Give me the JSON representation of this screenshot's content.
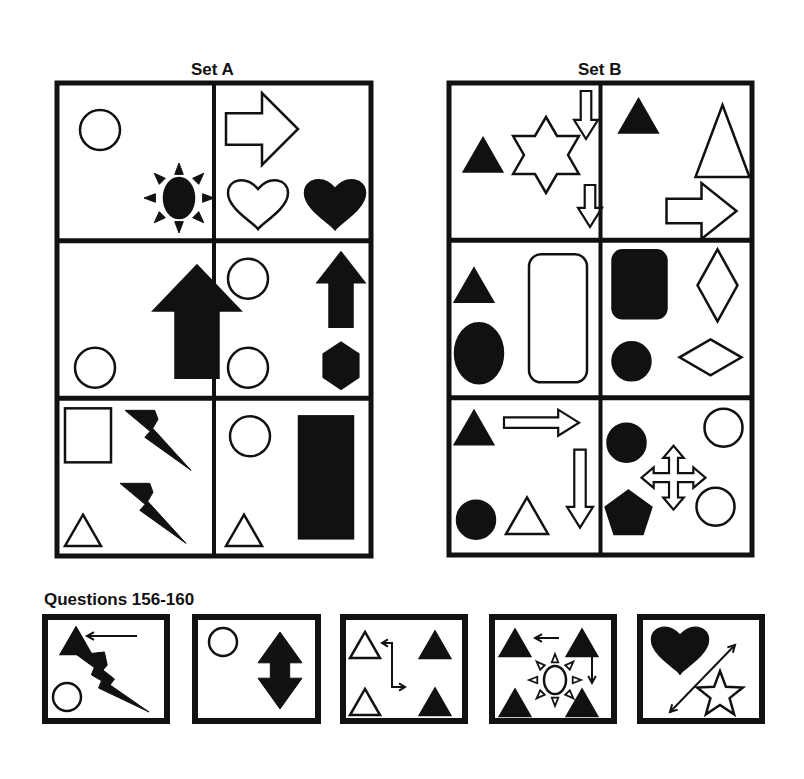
{
  "set_a": {
    "title": "Set A",
    "grid": {
      "x": 57,
      "y": 83,
      "w": 314,
      "h": 473,
      "rows": 3,
      "cols": 2
    },
    "cells": [
      {
        "name": "set-a-cell-1",
        "shapes": [
          {
            "type": "circle",
            "cx": 43,
            "cy": 47,
            "r": 20,
            "fill": false
          },
          {
            "type": "sun",
            "cx": 122,
            "cy": 115,
            "r": 15,
            "ry": 20,
            "ray": 35,
            "fill": true
          },
          {
            "type": "hidden"
          }
        ]
      },
      {
        "name": "set-a-cell-2",
        "shapes": [
          {
            "type": "block-arrow-right",
            "x": 12,
            "y": 10,
            "w": 72,
            "h": 72,
            "fill": false
          },
          {
            "type": "heart",
            "cx": 44,
            "cy": 120,
            "s": 30,
            "fill": false
          },
          {
            "type": "heart",
            "cx": 121,
            "cy": 120,
            "s": 30,
            "fill": true
          }
        ]
      },
      {
        "name": "set-a-cell-3",
        "shapes": [
          {
            "type": "circle",
            "cx": 38,
            "cy": 127,
            "r": 20,
            "fill": false
          },
          {
            "type": "block-arrow-up",
            "x": 97,
            "y": 25,
            "w": 86,
            "h": 112,
            "fill": true
          }
        ]
      },
      {
        "name": "set-a-cell-4",
        "shapes": [
          {
            "type": "circle",
            "cx": 34,
            "cy": 38,
            "r": 20,
            "fill": false
          },
          {
            "type": "circle",
            "cx": 34,
            "cy": 127,
            "r": 20,
            "fill": false
          },
          {
            "type": "block-arrow-up",
            "x": 104,
            "y": 12,
            "w": 46,
            "h": 74,
            "fill": true
          },
          {
            "type": "hexagon",
            "cx": 127,
            "cy": 125,
            "r": 23,
            "fill": true
          }
        ]
      },
      {
        "name": "set-a-cell-5",
        "shapes": [
          {
            "type": "rect",
            "x": 8,
            "y": 10,
            "w": 46,
            "h": 54,
            "fill": false
          },
          {
            "type": "lightning",
            "x": 68,
            "y": 12,
            "w": 66,
            "h": 60,
            "fill": true
          },
          {
            "type": "lightning",
            "x": 63,
            "y": 85,
            "w": 66,
            "h": 60,
            "fill": true
          },
          {
            "type": "triangle",
            "cx": 26,
            "cy": 132,
            "s": 36,
            "fill": false
          }
        ]
      },
      {
        "name": "set-a-cell-6",
        "shapes": [
          {
            "type": "circle",
            "cx": 36,
            "cy": 38,
            "r": 20,
            "fill": false
          },
          {
            "type": "triangle",
            "cx": 30,
            "cy": 132,
            "s": 36,
            "fill": false
          },
          {
            "type": "rect",
            "x": 85,
            "y": 18,
            "w": 54,
            "h": 122,
            "fill": true
          }
        ]
      }
    ]
  },
  "set_b": {
    "title": "Set B",
    "grid": {
      "x": 449,
      "y": 83,
      "w": 303,
      "h": 472,
      "rows": 3,
      "cols": 2
    },
    "cells": [
      {
        "name": "set-b-cell-1",
        "shapes": [
          {
            "type": "triangle",
            "cx": 34,
            "cy": 72,
            "s": 38,
            "fill": true
          },
          {
            "type": "star6",
            "cx": 97,
            "cy": 72,
            "r": 38,
            "fill": false
          },
          {
            "type": "thin-arrow-down-hollow",
            "x": 125,
            "y": 8,
            "w": 24,
            "h": 48,
            "fill": false
          },
          {
            "type": "thin-arrow-down-hollow",
            "x": 129,
            "y": 102,
            "w": 24,
            "h": 42,
            "fill": false
          }
        ]
      },
      {
        "name": "set-b-cell-2",
        "shapes": [
          {
            "type": "triangle",
            "cx": 38,
            "cy": 33,
            "s": 38,
            "fill": true
          },
          {
            "type": "triangle",
            "cx": 122,
            "cy": 58,
            "s": 54,
            "h": 72,
            "fill": false
          },
          {
            "type": "block-arrow-right",
            "x": 66,
            "y": 100,
            "w": 70,
            "h": 56,
            "fill": false
          }
        ]
      },
      {
        "name": "set-b-cell-3",
        "shapes": [
          {
            "type": "triangle",
            "cx": 25,
            "cy": 45,
            "s": 38,
            "fill": true
          },
          {
            "type": "ellipse",
            "cx": 30,
            "cy": 113,
            "rx": 24,
            "ry": 30,
            "fill": true
          },
          {
            "type": "roundrect",
            "x": 80,
            "y": 14,
            "w": 58,
            "h": 128,
            "rx": 12,
            "fill": false
          }
        ]
      },
      {
        "name": "set-b-cell-4",
        "shapes": [
          {
            "type": "roundrect",
            "x": 12,
            "y": 10,
            "w": 54,
            "h": 68,
            "rx": 10,
            "fill": true
          },
          {
            "type": "circle",
            "cx": 31,
            "cy": 121,
            "r": 19,
            "fill": true
          },
          {
            "type": "diamond",
            "cx": 117,
            "cy": 45,
            "w": 40,
            "h": 72,
            "fill": false
          },
          {
            "type": "diamond",
            "cx": 110,
            "cy": 117,
            "w": 62,
            "h": 36,
            "fill": false
          }
        ]
      },
      {
        "name": "set-b-cell-5",
        "shapes": [
          {
            "type": "triangle",
            "cx": 25,
            "cy": 30,
            "s": 38,
            "fill": true
          },
          {
            "type": "thin-arrow-right-hollow",
            "x": 55,
            "y": 12,
            "w": 75,
            "h": 26,
            "fill": false
          },
          {
            "type": "thin-arrow-down-hollow",
            "x": 118,
            "y": 52,
            "w": 26,
            "h": 78,
            "fill": false
          },
          {
            "type": "circle",
            "cx": 27,
            "cy": 122,
            "r": 19,
            "fill": true
          },
          {
            "type": "triangle",
            "cx": 78,
            "cy": 118,
            "s": 42,
            "fill": false
          }
        ]
      },
      {
        "name": "set-b-cell-6",
        "shapes": [
          {
            "type": "circle",
            "cx": 26,
            "cy": 45,
            "r": 19,
            "fill": true
          },
          {
            "type": "circle",
            "cx": 123,
            "cy": 30,
            "r": 19,
            "fill": false
          },
          {
            "type": "circle",
            "cx": 115,
            "cy": 109,
            "r": 19,
            "fill": false
          },
          {
            "type": "cross-arrows-hollow",
            "cx": 73,
            "cy": 80,
            "r": 32,
            "fill": false
          },
          {
            "type": "pentagon",
            "cx": 28,
            "cy": 117,
            "r": 24,
            "fill": true
          }
        ]
      }
    ]
  },
  "questions": {
    "title": "Questions 156-160",
    "boxes": [
      {
        "name": "question-156",
        "number": 156,
        "x": 45,
        "y": 617,
        "w": 122,
        "h": 104,
        "shapes": [
          {
            "type": "triangle",
            "cx": 31,
            "cy": 24,
            "s": 30,
            "fill": true
          },
          {
            "type": "line-arrow",
            "x1": 92,
            "y1": 19,
            "x2": 42,
            "y2": 19,
            "head": "end"
          },
          {
            "type": "lightning-long",
            "x": 32,
            "y": 35,
            "w": 72,
            "h": 60,
            "fill": true
          },
          {
            "type": "circle",
            "cx": 22,
            "cy": 80,
            "r": 14,
            "fill": false
          }
        ]
      },
      {
        "name": "question-157",
        "number": 157,
        "x": 195,
        "y": 617,
        "w": 123,
        "h": 104,
        "shapes": [
          {
            "type": "circle",
            "cx": 28,
            "cy": 25,
            "r": 14,
            "fill": false
          },
          {
            "type": "double-arrow-vertical",
            "cx": 85,
            "y1": 15,
            "y2": 92,
            "w": 44,
            "fill": true
          }
        ]
      },
      {
        "name": "question-158",
        "number": 158,
        "x": 343,
        "y": 617,
        "w": 122,
        "h": 104,
        "shapes": [
          {
            "type": "triangle",
            "cx": 22,
            "cy": 28,
            "s": 30,
            "fill": false
          },
          {
            "type": "triangle",
            "cx": 92,
            "cy": 28,
            "s": 30,
            "fill": true
          },
          {
            "type": "triangle",
            "cx": 22,
            "cy": 85,
            "s": 30,
            "fill": false
          },
          {
            "type": "triangle",
            "cx": 92,
            "cy": 85,
            "s": 30,
            "fill": true
          },
          {
            "type": "elbow-arrow",
            "points": "62,70 49,70 49,26 39,26",
            "end2": "62,70"
          }
        ]
      },
      {
        "name": "question-159",
        "number": 159,
        "x": 492,
        "y": 617,
        "w": 122,
        "h": 104,
        "shapes": [
          {
            "type": "triangle",
            "cx": 23,
            "cy": 26,
            "s": 30,
            "fill": true
          },
          {
            "type": "triangle",
            "cx": 90,
            "cy": 26,
            "s": 30,
            "fill": true
          },
          {
            "type": "triangle",
            "cx": 23,
            "cy": 86,
            "s": 30,
            "fill": true
          },
          {
            "type": "triangle",
            "cx": 90,
            "cy": 86,
            "s": 30,
            "fill": true
          },
          {
            "type": "line-arrow",
            "x1": 67,
            "y1": 21,
            "x2": 43,
            "y2": 21,
            "head": "end"
          },
          {
            "type": "line-arrow",
            "x1": 100,
            "y1": 40,
            "x2": 100,
            "y2": 66,
            "head": "end"
          },
          {
            "type": "sun",
            "cx": 63,
            "cy": 63,
            "r": 11,
            "ry": 14,
            "ray": 26,
            "fill": false
          }
        ]
      },
      {
        "name": "question-160",
        "number": 160,
        "x": 640,
        "y": 617,
        "w": 122,
        "h": 104,
        "shapes": [
          {
            "type": "heart",
            "cx": 40,
            "cy": 32,
            "s": 28,
            "fill": true
          },
          {
            "type": "line-arrow",
            "x1": 30,
            "y1": 95,
            "x2": 95,
            "y2": 28,
            "head": "both"
          },
          {
            "type": "star5",
            "cx": 80,
            "cy": 78,
            "r": 24,
            "fill": false
          }
        ]
      }
    ]
  },
  "colors": {
    "ink": "#111111",
    "paper": "#ffffff"
  }
}
